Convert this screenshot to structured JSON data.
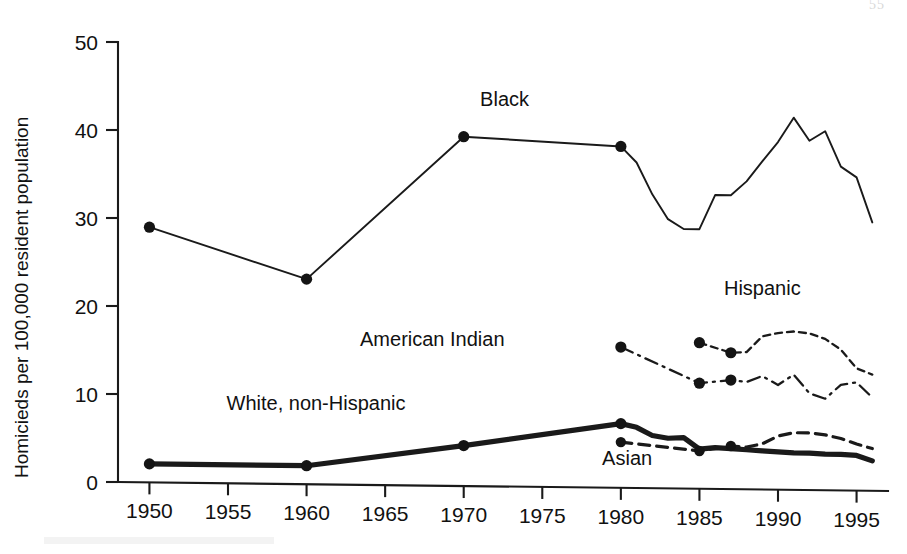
{
  "figure": {
    "page_number": "55",
    "background_color": "#ffffff",
    "ink_color": "#1a1a1a"
  },
  "chart_data": {
    "type": "line",
    "title": "",
    "xlabel": "",
    "ylabel": "Homicieds per 100,000 resident population",
    "xlim": [
      1948,
      1997
    ],
    "ylim": [
      0,
      50
    ],
    "xticks": [
      1950,
      1955,
      1960,
      1965,
      1970,
      1975,
      1980,
      1985,
      1990,
      1995
    ],
    "xtick_labels": [
      "1950",
      "1955",
      "1960",
      "1965",
      "1970",
      "1975",
      "1980",
      "1985",
      "1990",
      "1995"
    ],
    "yticks": [
      0,
      10,
      20,
      30,
      40,
      50
    ],
    "ytick_labels": [
      "0",
      "10",
      "20",
      "30",
      "40",
      "50"
    ],
    "grid": false,
    "legend": "inline-annotations",
    "series": [
      {
        "name": "Black",
        "label": "Black",
        "line_style": "solid",
        "line_width": "thin",
        "marker": "filled-circle-on-decennial",
        "label_position": {
          "x": 1972.6,
          "y": 43.2
        },
        "x": [
          1950,
          1960,
          1970,
          1980,
          1981,
          1982,
          1983,
          1984,
          1985,
          1986,
          1987,
          1988,
          1989,
          1990,
          1991,
          1992,
          1993,
          1994,
          1995,
          1996
        ],
        "y": [
          29.0,
          23.3,
          39.7,
          38.8,
          37.0,
          33.4,
          30.6,
          29.5,
          29.5,
          33.4,
          33.4,
          35.0,
          37.3,
          39.5,
          42.3,
          39.7,
          40.8,
          36.8,
          35.6,
          30.5
        ],
        "marker_x": [
          1950,
          1960,
          1970,
          1980
        ],
        "marker_y": [
          29.0,
          23.3,
          39.7,
          38.8
        ]
      },
      {
        "name": "American Indian",
        "label": "American Indian",
        "line_style": "dash-dot",
        "line_width": "medium",
        "marker": "filled-circle",
        "label_position": {
          "x": 1968.0,
          "y": 15.9
        },
        "x": [
          1980,
          1985,
          1987,
          1988,
          1989,
          1990,
          1991,
          1992,
          1993,
          1994,
          1995,
          1996
        ],
        "y": [
          16.0,
          12.0,
          12.4,
          12.2,
          12.9,
          11.9,
          13.1,
          11.0,
          10.4,
          12.0,
          12.3,
          10.6
        ],
        "marker_x": [
          1980,
          1985,
          1987
        ],
        "marker_y": [
          16.0,
          12.0,
          12.4
        ]
      },
      {
        "name": "Hispanic",
        "label": "Hispanic",
        "line_style": "dotted",
        "line_width": "medium",
        "marker": "filled-circle",
        "label_position": {
          "x": 1989.0,
          "y": 22.1
        },
        "x": [
          1985,
          1987,
          1988,
          1989,
          1990,
          1991,
          1992,
          1993,
          1994,
          1995,
          1996
        ],
        "y": [
          16.6,
          15.5,
          15.6,
          17.4,
          17.8,
          18.0,
          17.8,
          17.2,
          16.0,
          13.9,
          13.2
        ],
        "marker_x": [
          1985,
          1987
        ],
        "marker_y": [
          16.6,
          15.5
        ]
      },
      {
        "name": "White, non-Hispanic",
        "label": "White, non-Hispanic",
        "line_style": "solid",
        "line_width": "thick",
        "marker": "filled-circle-on-decennial",
        "label_position": {
          "x": 1960.6,
          "y": 8.5
        },
        "x": [
          1950,
          1960,
          1970,
          1980,
          1981,
          1982,
          1983,
          1984,
          1985,
          1986,
          1987,
          1988,
          1989,
          1990,
          1991,
          1992,
          1993,
          1994,
          1995,
          1996
        ],
        "y": [
          2.1,
          2.1,
          4.6,
          7.3,
          6.9,
          6.0,
          5.7,
          5.8,
          4.5,
          4.7,
          4.6,
          4.5,
          4.4,
          4.3,
          4.2,
          4.2,
          4.1,
          4.1,
          4.0,
          3.4
        ],
        "marker_x": [
          1950,
          1960,
          1970,
          1980
        ],
        "marker_y": [
          2.1,
          2.1,
          4.6,
          7.3
        ]
      },
      {
        "name": "Asian",
        "label": "Asian",
        "line_style": "dashed",
        "line_width": "medium",
        "marker": "filled-circle",
        "label_position": {
          "x": 1980.4,
          "y": 2.6
        },
        "x": [
          1980,
          1985,
          1987,
          1988,
          1989,
          1990,
          1991,
          1992,
          1993,
          1994,
          1995,
          1996
        ],
        "y": [
          5.2,
          4.3,
          4.9,
          4.8,
          5.2,
          6.1,
          6.5,
          6.5,
          6.3,
          5.9,
          5.3,
          4.8
        ],
        "marker_x": [
          1980,
          1985,
          1987
        ],
        "marker_y": [
          5.2,
          4.3,
          4.9
        ]
      }
    ]
  }
}
